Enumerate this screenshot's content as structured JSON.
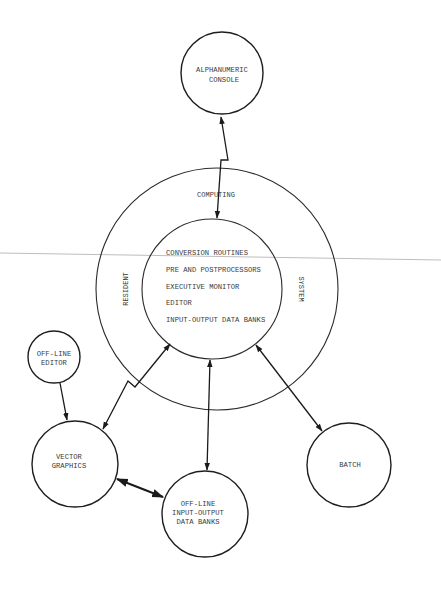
{
  "diagram": {
    "type": "system-architecture",
    "colors": {
      "ink": "#1e1e1e",
      "text": "#3a3a3a",
      "background": "#ffffff",
      "scan_line": "#bdbdbd"
    },
    "core": {
      "outer_ring_labels": {
        "top": "COMPUTING",
        "left": "RESIDENT",
        "right": "SYSTEM"
      },
      "modules": [
        "CONVERSION ROUTINES",
        "PRE AND POSTPROCESSORS",
        "EXECUTIVE MONITOR",
        "EDITOR",
        "INPUT-OUTPUT DATA BANKS"
      ]
    },
    "nodes": {
      "alphanumeric_console": {
        "line1": "ALPHANUMERIC",
        "line2": "CONSOLE"
      },
      "offline_editor": {
        "line1": "OFF-LINE",
        "line2": "EDITOR"
      },
      "vector_graphics": {
        "line1": "VECTOR",
        "line2": "GRAPHICS"
      },
      "offline_io": {
        "line1": "OFF-LINE",
        "line2": "INPUT-OUTPUT",
        "line3": "DATA BANKS"
      },
      "batch": {
        "line1": "BATCH"
      }
    },
    "connections": [
      {
        "from": "ALPHANUMERIC CONSOLE",
        "to": "RESIDENT COMPUTING SYSTEM",
        "direction": "bidirectional"
      },
      {
        "from": "RESIDENT COMPUTING SYSTEM",
        "to": "VECTOR GRAPHICS",
        "direction": "bidirectional"
      },
      {
        "from": "RESIDENT COMPUTING SYSTEM",
        "to": "OFF-LINE INPUT-OUTPUT DATA BANKS",
        "direction": "bidirectional"
      },
      {
        "from": "RESIDENT COMPUTING SYSTEM",
        "to": "BATCH",
        "direction": "bidirectional"
      },
      {
        "from": "OFF-LINE EDITOR",
        "to": "VECTOR GRAPHICS",
        "direction": "one-way"
      },
      {
        "from": "VECTOR GRAPHICS",
        "to": "OFF-LINE INPUT-OUTPUT DATA BANKS",
        "direction": "bidirectional"
      }
    ]
  }
}
